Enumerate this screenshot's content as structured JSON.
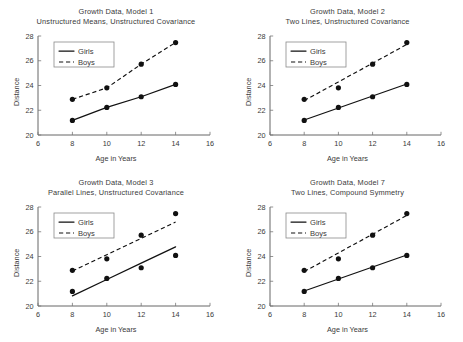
{
  "figure": {
    "panel_count": 4,
    "background": "#ffffff",
    "ink_color": "#111111"
  },
  "chart_data": [
    {
      "type": "line",
      "title": "Growth Data, Model 1",
      "subtitle": "Unstructured Means, Unstructured Covariance",
      "xlabel": "Age in Years",
      "ylabel": "Distance",
      "xlim": [
        6,
        16
      ],
      "ylim": [
        20,
        28
      ],
      "xticks": [
        6,
        8,
        10,
        12,
        14,
        16
      ],
      "yticks": [
        20,
        22,
        24,
        26,
        28
      ],
      "grid": false,
      "legend": [
        "Girls",
        "Boys"
      ],
      "legend_position": "upper-left",
      "x": [
        8,
        10,
        12,
        14
      ],
      "series": [
        {
          "name": "Girls",
          "style": "solid",
          "marker": "filled-circle",
          "values": [
            21.18,
            22.23,
            23.09,
            24.09
          ],
          "fit": [
            21.18,
            22.23,
            23.09,
            24.09
          ]
        },
        {
          "name": "Boys",
          "style": "dashed",
          "marker": "filled-circle",
          "values": [
            22.88,
            23.81,
            25.72,
            27.47
          ],
          "fit": [
            22.88,
            23.81,
            25.72,
            27.47
          ]
        }
      ],
      "note": "Fitted profiles join observed means exactly"
    },
    {
      "type": "line",
      "title": "Growth Data, Model 2",
      "subtitle": "Two Lines, Unstructured Covariance",
      "xlabel": "Age in Years",
      "ylabel": "Distance",
      "xlim": [
        6,
        16
      ],
      "ylim": [
        20,
        28
      ],
      "xticks": [
        6,
        8,
        10,
        12,
        14,
        16
      ],
      "yticks": [
        20,
        22,
        24,
        26,
        28
      ],
      "grid": false,
      "legend": [
        "Girls",
        "Boys"
      ],
      "legend_position": "upper-left",
      "x": [
        8,
        10,
        12,
        14
      ],
      "series": [
        {
          "name": "Girls",
          "style": "solid",
          "marker": "filled-circle",
          "values": [
            21.18,
            22.23,
            23.09,
            24.09
          ],
          "fit": [
            21.21,
            22.18,
            23.15,
            24.12
          ]
        },
        {
          "name": "Boys",
          "style": "dashed",
          "marker": "filled-circle",
          "values": [
            22.88,
            23.81,
            25.72,
            27.47
          ],
          "fit": [
            22.78,
            24.29,
            25.8,
            27.32
          ]
        }
      ],
      "note": "Separate straight-line fits per group"
    },
    {
      "type": "line",
      "title": "Growth Data, Model 3",
      "subtitle": "Parallel Lines, Unstructured Covariance",
      "xlabel": "Age in Years",
      "ylabel": "Distance",
      "xlim": [
        6,
        16
      ],
      "ylim": [
        20,
        28
      ],
      "xticks": [
        6,
        8,
        10,
        12,
        14,
        16
      ],
      "yticks": [
        20,
        22,
        24,
        26,
        28
      ],
      "grid": false,
      "legend": [
        "Girls",
        "Boys"
      ],
      "legend_position": "upper-left",
      "x": [
        8,
        10,
        12,
        14
      ],
      "series": [
        {
          "name": "Girls",
          "style": "solid",
          "marker": "filled-circle",
          "values": [
            21.18,
            22.23,
            23.09,
            24.09
          ],
          "fit": [
            20.82,
            22.14,
            23.46,
            24.78
          ]
        },
        {
          "name": "Boys",
          "style": "dashed",
          "marker": "filled-circle",
          "values": [
            22.88,
            23.81,
            25.72,
            27.47
          ],
          "fit": [
            22.82,
            24.14,
            25.46,
            26.78
          ]
        }
      ],
      "note": "Common slope, different intercepts"
    },
    {
      "type": "line",
      "title": "Growth Data, Model 7",
      "subtitle": "Two Lines, Compound Symmetry",
      "xlabel": "Age in Years",
      "ylabel": "Distance",
      "xlim": [
        6,
        16
      ],
      "ylim": [
        20,
        28
      ],
      "xticks": [
        6,
        8,
        10,
        12,
        14,
        16
      ],
      "yticks": [
        20,
        22,
        24,
        26,
        28
      ],
      "grid": false,
      "legend": [
        "Girls",
        "Boys"
      ],
      "legend_position": "upper-left",
      "x": [
        8,
        10,
        12,
        14
      ],
      "series": [
        {
          "name": "Girls",
          "style": "solid",
          "marker": "filled-circle",
          "values": [
            21.18,
            22.23,
            23.09,
            24.09
          ],
          "fit": [
            21.21,
            22.18,
            23.15,
            24.12
          ]
        },
        {
          "name": "Boys",
          "style": "dashed",
          "marker": "filled-circle",
          "values": [
            22.88,
            23.81,
            25.72,
            27.47
          ],
          "fit": [
            22.78,
            24.29,
            25.8,
            27.32
          ]
        }
      ],
      "note": "Separate straight-line fits, compound symmetric errors"
    }
  ]
}
